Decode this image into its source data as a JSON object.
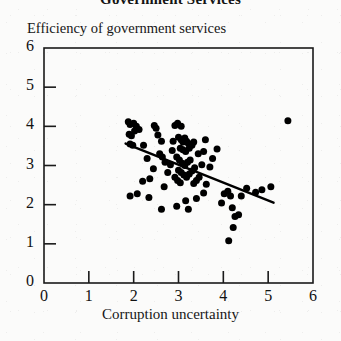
{
  "chart_data": {
    "type": "scatter",
    "title": "Government Services",
    "xlabel": "Corruption uncertainty",
    "ylabel": "Efficiency of government services",
    "xlim": [
      0,
      6
    ],
    "ylim": [
      0,
      6
    ],
    "xticks": [
      "0",
      "1",
      "2",
      "3",
      "4",
      "5",
      "6"
    ],
    "yticks": [
      "0",
      "1",
      "2",
      "3",
      "4",
      "5",
      "6"
    ],
    "xtick_values": [
      0,
      1,
      2,
      3,
      4,
      5,
      6
    ],
    "ytick_values": [
      0,
      1,
      2,
      3,
      4,
      5,
      6
    ],
    "grid": false,
    "legend": null,
    "marker": "filled-circle",
    "marker_color": "#000000",
    "marker_size_px": 7,
    "frame_color": "#1a1a1a",
    "points": [
      [
        1.88,
        4.12
      ],
      [
        1.92,
        4.05
      ],
      [
        2.0,
        4.08
      ],
      [
        2.06,
        4.0
      ],
      [
        1.9,
        3.8
      ],
      [
        1.95,
        3.76
      ],
      [
        2.02,
        3.88
      ],
      [
        2.12,
        3.92
      ],
      [
        1.92,
        3.55
      ],
      [
        1.98,
        3.52
      ],
      [
        2.22,
        3.52
      ],
      [
        2.3,
        3.18
      ],
      [
        2.46,
        4.02
      ],
      [
        2.5,
        3.95
      ],
      [
        2.54,
        3.78
      ],
      [
        2.62,
        3.62
      ],
      [
        2.58,
        3.3
      ],
      [
        2.64,
        3.22
      ],
      [
        2.7,
        3.08
      ],
      [
        2.44,
        2.92
      ],
      [
        2.36,
        2.66
      ],
      [
        2.2,
        2.6
      ],
      [
        2.08,
        2.28
      ],
      [
        1.92,
        2.22
      ],
      [
        2.34,
        2.18
      ],
      [
        2.62,
        1.88
      ],
      [
        2.68,
        2.46
      ],
      [
        2.76,
        2.82
      ],
      [
        2.82,
        3.02
      ],
      [
        2.86,
        3.38
      ],
      [
        2.88,
        3.62
      ],
      [
        2.92,
        4.02
      ],
      [
        2.98,
        4.08
      ],
      [
        3.06,
        4.0
      ],
      [
        3.0,
        3.72
      ],
      [
        3.06,
        3.66
      ],
      [
        3.1,
        3.6
      ],
      [
        3.14,
        3.7
      ],
      [
        3.18,
        3.62
      ],
      [
        3.22,
        3.56
      ],
      [
        3.04,
        3.44
      ],
      [
        3.1,
        3.4
      ],
      [
        3.16,
        3.36
      ],
      [
        3.24,
        3.44
      ],
      [
        3.3,
        3.52
      ],
      [
        3.34,
        3.6
      ],
      [
        2.96,
        3.22
      ],
      [
        3.02,
        3.14
      ],
      [
        3.08,
        3.06
      ],
      [
        3.14,
        3.0
      ],
      [
        3.2,
        3.08
      ],
      [
        3.26,
        3.14
      ],
      [
        3.0,
        2.88
      ],
      [
        3.06,
        2.82
      ],
      [
        3.12,
        2.76
      ],
      [
        3.18,
        2.7
      ],
      [
        3.24,
        2.78
      ],
      [
        3.3,
        2.86
      ],
      [
        3.36,
        2.94
      ],
      [
        2.92,
        2.7
      ],
      [
        2.98,
        2.62
      ],
      [
        3.04,
        2.56
      ],
      [
        3.34,
        2.54
      ],
      [
        3.4,
        2.62
      ],
      [
        3.46,
        2.7
      ],
      [
        3.52,
        3.02
      ],
      [
        3.56,
        3.36
      ],
      [
        3.6,
        3.66
      ],
      [
        3.44,
        3.3
      ],
      [
        3.7,
        2.96
      ],
      [
        3.76,
        3.18
      ],
      [
        3.86,
        3.42
      ],
      [
        3.62,
        2.52
      ],
      [
        3.56,
        2.3
      ],
      [
        3.4,
        2.16
      ],
      [
        3.16,
        2.1
      ],
      [
        2.96,
        1.96
      ],
      [
        3.22,
        1.88
      ],
      [
        3.96,
        2.04
      ],
      [
        4.02,
        2.28
      ],
      [
        4.1,
        2.34
      ],
      [
        4.16,
        2.22
      ],
      [
        4.2,
        1.92
      ],
      [
        4.26,
        1.7
      ],
      [
        4.34,
        1.74
      ],
      [
        4.22,
        1.42
      ],
      [
        4.12,
        1.08
      ],
      [
        4.4,
        2.22
      ],
      [
        4.52,
        2.42
      ],
      [
        4.72,
        2.32
      ],
      [
        4.86,
        2.38
      ],
      [
        5.06,
        2.46
      ],
      [
        5.44,
        4.14
      ]
    ],
    "trendline": {
      "label": "fitted regression line",
      "x0": 1.82,
      "y0": 3.56,
      "x1": 5.12,
      "y1": 2.05,
      "color": "#000000",
      "width_px": 2.4
    }
  }
}
